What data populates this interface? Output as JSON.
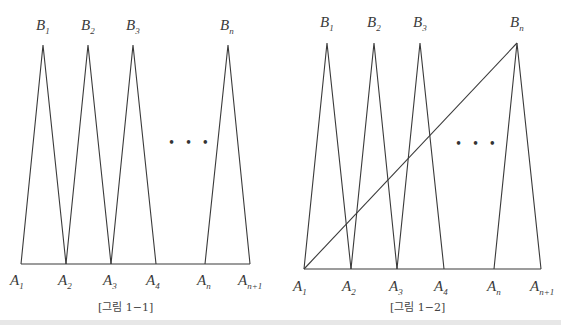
{
  "figures": [
    {
      "id": "fig-1-1",
      "caption": "[그림 1−1]",
      "baseline_y": 264,
      "apex_y": 45,
      "bottom_points": [
        {
          "name": "A",
          "sub": "1",
          "x": 21
        },
        {
          "name": "A",
          "sub": "2",
          "x": 66
        },
        {
          "name": "A",
          "sub": "3",
          "x": 111
        },
        {
          "name": "A",
          "sub": "4",
          "x": 156
        },
        {
          "name": "A",
          "sub": "n",
          "x": 205
        },
        {
          "name": "A",
          "sub": "n+1",
          "x": 250
        }
      ],
      "top_points": [
        {
          "name": "B",
          "sub": "1",
          "x": 43
        },
        {
          "name": "B",
          "sub": "2",
          "x": 88
        },
        {
          "name": "B",
          "sub": "3",
          "x": 133
        },
        {
          "name": "B",
          "sub": "n",
          "x": 228
        }
      ],
      "ellipsis": "• • •",
      "diagonal": null
    },
    {
      "id": "fig-1-2",
      "caption": "[그림 1−2]",
      "baseline_y": 269,
      "apex_y": 43,
      "bottom_points": [
        {
          "name": "A",
          "sub": "1",
          "x": 304
        },
        {
          "name": "A",
          "sub": "2",
          "x": 351
        },
        {
          "name": "A",
          "sub": "3",
          "x": 397
        },
        {
          "name": "A",
          "sub": "4",
          "x": 444
        },
        {
          "name": "A",
          "sub": "n",
          "x": 494
        },
        {
          "name": "A",
          "sub": "n+1",
          "x": 541
        }
      ],
      "top_points": [
        {
          "name": "B",
          "sub": "1",
          "x": 327
        },
        {
          "name": "B",
          "sub": "2",
          "x": 374
        },
        {
          "name": "B",
          "sub": "3",
          "x": 420
        },
        {
          "name": "B",
          "sub": "n",
          "x": 517
        }
      ],
      "ellipsis": "• • •",
      "diagonal": {
        "from": "A1",
        "to": "Bn"
      }
    }
  ],
  "labels": {
    "fig1": {
      "B1": "B",
      "B1s": "1",
      "B2": "B",
      "B2s": "2",
      "B3": "B",
      "B3s": "3",
      "Bn": "B",
      "Bns": "n",
      "A1": "A",
      "A1s": "1",
      "A2": "A",
      "A2s": "2",
      "A3": "A",
      "A3s": "3",
      "A4": "A",
      "A4s": "4",
      "An": "A",
      "Ans": "n",
      "An1": "A",
      "An1s": "n+1",
      "dots": "• • •",
      "caption": "[그림 1−1]"
    },
    "fig2": {
      "B1": "B",
      "B1s": "1",
      "B2": "B",
      "B2s": "2",
      "B3": "B",
      "B3s": "3",
      "Bn": "B",
      "Bns": "n",
      "A1": "A",
      "A1s": "1",
      "A2": "A",
      "A2s": "2",
      "A3": "A",
      "A3s": "3",
      "A4": "A",
      "A4s": "4",
      "An": "A",
      "Ans": "n",
      "An1": "A",
      "An1s": "n+1",
      "dots": "• • •",
      "caption": "[그림 1−2]"
    }
  }
}
